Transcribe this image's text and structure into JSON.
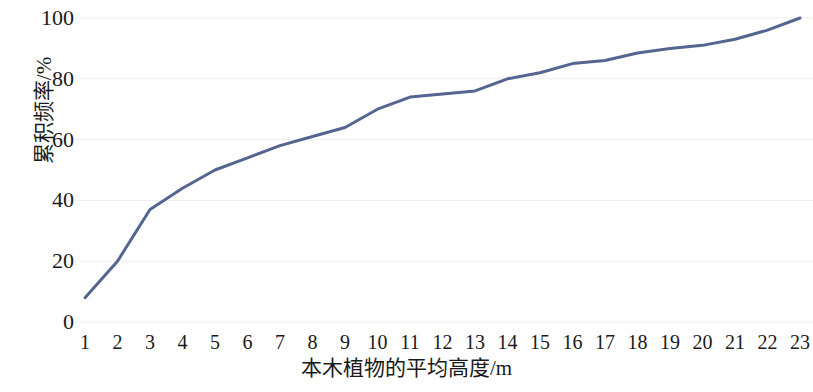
{
  "chart_data": {
    "type": "line",
    "title": "",
    "subtitle": "",
    "xlabel": "本木植物的平均高度/m",
    "ylabel": "累积频率/%",
    "x": [
      1,
      2,
      3,
      4,
      5,
      6,
      7,
      8,
      9,
      10,
      11,
      12,
      13,
      14,
      15,
      16,
      17,
      18,
      19,
      20,
      21,
      22,
      23
    ],
    "values": [
      8,
      20,
      37,
      44,
      50,
      54,
      58,
      61,
      64,
      70,
      74,
      75,
      76,
      80,
      82,
      85,
      86,
      88.5,
      90,
      91,
      93,
      96,
      100
    ],
    "series": [
      {
        "name": "累积频率",
        "values": [
          8,
          20,
          37,
          44,
          50,
          54,
          58,
          61,
          64,
          70,
          74,
          75,
          76,
          80,
          82,
          85,
          86,
          88.5,
          90,
          91,
          93,
          96,
          100
        ],
        "color": "#54658f"
      }
    ],
    "xticklabels": [
      "1",
      "2",
      "3",
      "4",
      "5",
      "6",
      "7",
      "8",
      "9",
      "10",
      "11",
      "12",
      "13",
      "14",
      "15",
      "16",
      "17",
      "18",
      "19",
      "20",
      "21",
      "22",
      "23"
    ],
    "yticklabels": [
      "0",
      "20",
      "40",
      "60",
      "80",
      "100"
    ],
    "yticks": [
      0,
      20,
      40,
      60,
      80,
      100
    ],
    "xlim": [
      1,
      23
    ],
    "ylim": [
      0,
      100
    ],
    "grid": "horizontal",
    "grid_color": "#ededed",
    "legend": "none",
    "line_color": "#54658f",
    "line_width": 3,
    "markers": "none",
    "axis_line": "none",
    "background": "#ffffff"
  }
}
